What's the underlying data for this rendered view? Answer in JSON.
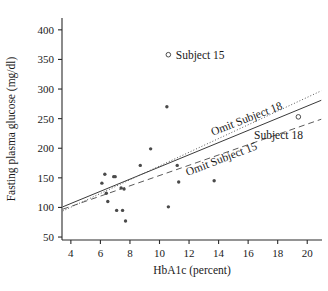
{
  "chart_data": {
    "type": "scatter",
    "title": "",
    "xlabel": "HbA1c (percent)",
    "ylabel": "Fasting plasma glucose (mg/dl)",
    "xlim": [
      3.4,
      21.0
    ],
    "ylim": [
      45,
      420
    ],
    "xticks": [
      4,
      6,
      8,
      10,
      12,
      14,
      16,
      18,
      20
    ],
    "xtick_labels": [
      "4",
      "6",
      "8",
      "10",
      "12",
      "14",
      "16",
      "18",
      "20"
    ],
    "yticks": [
      50,
      100,
      150,
      200,
      250,
      300,
      350,
      400
    ],
    "ytick_labels": [
      "50",
      "100",
      "150",
      "200",
      "250",
      "300",
      "350",
      "400"
    ],
    "grid": false,
    "legend": "none",
    "points": [
      {
        "x": 6.1,
        "y": 141,
        "marker": "filled"
      },
      {
        "x": 6.3,
        "y": 156,
        "marker": "filled"
      },
      {
        "x": 6.4,
        "y": 124,
        "marker": "filled"
      },
      {
        "x": 6.5,
        "y": 110,
        "marker": "filled"
      },
      {
        "x": 6.9,
        "y": 152,
        "marker": "filled"
      },
      {
        "x": 7.0,
        "y": 152,
        "marker": "filled"
      },
      {
        "x": 7.1,
        "y": 95,
        "marker": "filled"
      },
      {
        "x": 7.4,
        "y": 133,
        "marker": "filled"
      },
      {
        "x": 7.5,
        "y": 95,
        "marker": "filled"
      },
      {
        "x": 7.6,
        "y": 131,
        "marker": "filled"
      },
      {
        "x": 7.7,
        "y": 77,
        "marker": "filled"
      },
      {
        "x": 8.7,
        "y": 171,
        "marker": "filled"
      },
      {
        "x": 9.4,
        "y": 199,
        "marker": "filled"
      },
      {
        "x": 10.5,
        "y": 270,
        "marker": "filled"
      },
      {
        "x": 10.6,
        "y": 101,
        "marker": "filled"
      },
      {
        "x": 10.6,
        "y": 358,
        "marker": "open"
      },
      {
        "x": 11.2,
        "y": 171,
        "marker": "filled"
      },
      {
        "x": 11.3,
        "y": 143,
        "marker": "filled"
      },
      {
        "x": 13.7,
        "y": 145,
        "marker": "filled"
      },
      {
        "x": 19.4,
        "y": 253,
        "marker": "open"
      }
    ],
    "fit_lines": [
      {
        "name": "All data",
        "style": "solid",
        "x1": 3.45,
        "y1": 101,
        "x2": 20.95,
        "y2": 281
      },
      {
        "name": "Omit Subject 18",
        "style": "dotted",
        "x1": 3.45,
        "y1": 94,
        "x2": 20.95,
        "y2": 297
      },
      {
        "name": "Omit Subject 15",
        "style": "dashed",
        "x1": 3.45,
        "y1": 97,
        "x2": 20.95,
        "y2": 249
      }
    ],
    "annotations": [
      {
        "id": "subject-15",
        "text": "Subject 15",
        "x": 11.1,
        "y": 358,
        "rotation": 0,
        "marker": "open"
      },
      {
        "id": "subject-18",
        "text": "Subject 18",
        "x": 16.4,
        "y": 222,
        "rotation": 0,
        "marker": "none"
      },
      {
        "id": "omit-subject-18",
        "text": "Omit Subject 18",
        "x": 13.6,
        "y": 228,
        "rotation": -21,
        "marker": "none"
      },
      {
        "id": "omit-subject-15",
        "text": "Omit Subject 15",
        "x": 11.9,
        "y": 160,
        "rotation": -21,
        "marker": "none"
      }
    ]
  }
}
